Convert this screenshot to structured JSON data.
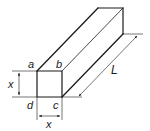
{
  "diagram": {
    "type": "square-bar-prism",
    "labels": {
      "a": "a",
      "b": "b",
      "c": "c",
      "d": "d",
      "height": "x",
      "width": "x",
      "length": "L"
    },
    "colors": {
      "stroke": "#1a1a1a",
      "background": "#ffffff"
    }
  }
}
